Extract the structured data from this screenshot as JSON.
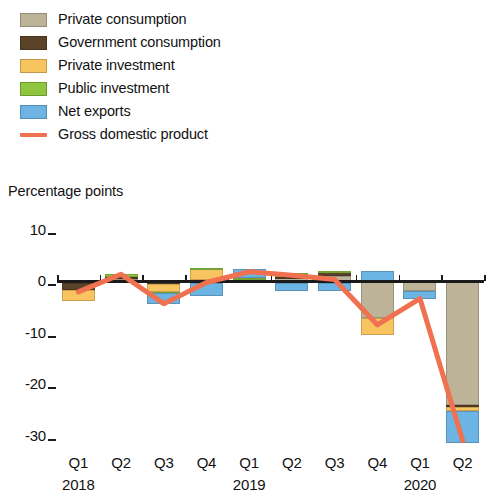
{
  "legend": {
    "items": [
      {
        "label": "Private consumption",
        "color": "#bdb398",
        "kind": "swatch",
        "key": "private_consumption"
      },
      {
        "label": "Government consumption",
        "color": "#5b432a",
        "kind": "swatch",
        "key": "government_consumption"
      },
      {
        "label": "Private investment",
        "color": "#f8c460",
        "kind": "swatch",
        "key": "private_investment"
      },
      {
        "label": "Public investment",
        "color": "#8fc63f",
        "kind": "swatch",
        "key": "public_investment"
      },
      {
        "label": "Net exports",
        "color": "#6cb4e4",
        "kind": "swatch",
        "key": "net_exports"
      },
      {
        "label": "Gross domestic product",
        "color": "#f0714f",
        "kind": "line",
        "key": "gdp"
      }
    ]
  },
  "axis": {
    "y_title": "Percentage points",
    "y_ticks": [
      10,
      0,
      -10,
      -20,
      -30
    ],
    "y_tick_labels": [
      "10",
      "0",
      "-10",
      "-20",
      "-30"
    ],
    "ylim": [
      -33,
      12
    ],
    "x_quarter_labels": [
      "Q1",
      "Q2",
      "Q3",
      "Q4",
      "Q1",
      "Q2",
      "Q3",
      "Q4",
      "Q1",
      "Q2"
    ],
    "x_year_labels": [
      {
        "text": "2018",
        "index": 0
      },
      {
        "text": "2019",
        "index": 4
      },
      {
        "text": "2020",
        "index": 8
      }
    ]
  },
  "chart_data": {
    "type": "bar",
    "title": "",
    "subtitle": "",
    "xlabel": "",
    "ylabel": "Percentage points",
    "ylim": [
      -33,
      12
    ],
    "grid": false,
    "legend_position": "top-left",
    "stacked": true,
    "categories": [
      "Q1 2018",
      "Q2 2018",
      "Q3 2018",
      "Q4 2018",
      "Q1 2019",
      "Q2 2019",
      "Q3 2019",
      "Q4 2019",
      "Q1 2020",
      "Q2 2020"
    ],
    "series": [
      {
        "name": "Private consumption",
        "color": "#bdb398",
        "values": [
          -0.3,
          0.4,
          -0.2,
          0.1,
          0.2,
          0.5,
          1.0,
          -7.2,
          -2.0,
          -24.0
        ]
      },
      {
        "name": "Government consumption",
        "color": "#5b432a",
        "values": [
          -1.4,
          0.3,
          -0.4,
          -0.4,
          -0.2,
          0.3,
          0.7,
          0.0,
          0.0,
          -0.4
        ]
      },
      {
        "name": "Private investment",
        "color": "#f8c460",
        "values": [
          -2.1,
          -0.3,
          -1.6,
          2.4,
          0.2,
          -0.3,
          -0.3,
          -3.3,
          0.0,
          -0.9
        ]
      },
      {
        "name": "Public investment",
        "color": "#8fc63f",
        "values": [
          0.0,
          0.6,
          -0.2,
          0.1,
          0.2,
          0.7,
          0.3,
          0.0,
          0.0,
          0.0
        ]
      },
      {
        "name": "Net exports",
        "color": "#6cb4e4",
        "values": [
          0.0,
          0.0,
          -2.1,
          -2.5,
          1.8,
          -1.7,
          -1.6,
          2.0,
          -1.4,
          -6.1
        ]
      }
    ],
    "gdp_line": {
      "name": "Gross domestic product",
      "color": "#f0714f",
      "values": [
        -2.1,
        1.3,
        -4.4,
        -0.3,
        1.8,
        1.1,
        0.3,
        -8.5,
        -3.4,
        -31.0
      ]
    }
  }
}
